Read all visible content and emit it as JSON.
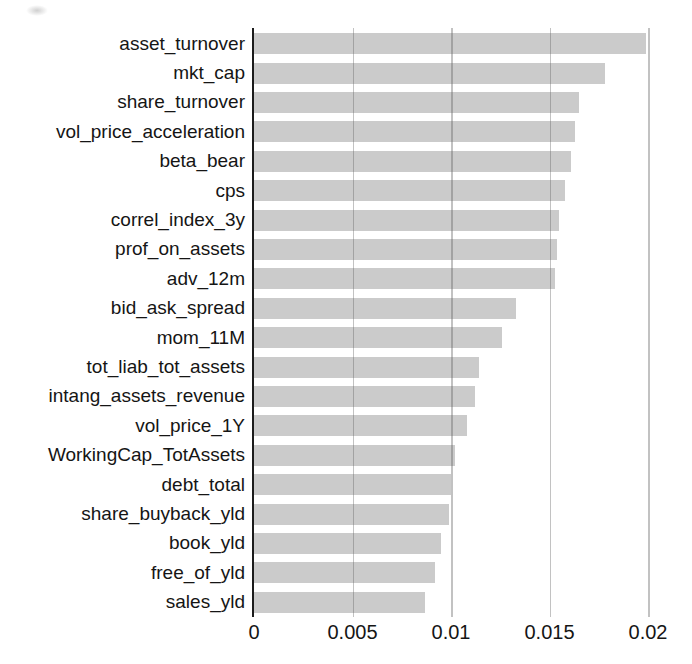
{
  "chart_data": {
    "type": "bar",
    "orientation": "horizontal",
    "title": "",
    "xlabel": "",
    "ylabel": "",
    "categories": [
      "asset_turnover",
      "mkt_cap",
      "share_turnover",
      "vol_price_acceleration",
      "beta_bear",
      "cps",
      "correl_index_3y",
      "prof_on_assets",
      "adv_12m",
      "bid_ask_spread",
      "mom_11M",
      "tot_liab_tot_assets",
      "intang_assets_revenue",
      "vol_price_1Y",
      "WorkingCap_TotAssets",
      "debt_total",
      "share_buyback_yld",
      "book_yld",
      "free_of_yld",
      "sales_yld"
    ],
    "values": [
      0.0199,
      0.0178,
      0.0165,
      0.0163,
      0.0161,
      0.0158,
      0.0155,
      0.0154,
      0.0153,
      0.0133,
      0.0126,
      0.0114,
      0.0112,
      0.0108,
      0.0102,
      0.01,
      0.0099,
      0.0095,
      0.0092,
      0.0087
    ],
    "xlim": [
      0,
      0.0205
    ],
    "x_ticks": [
      0,
      0.005,
      0.01,
      0.015,
      0.02
    ],
    "x_tick_labels": [
      "0",
      "0.005",
      "0.01",
      "0.015",
      "0.02"
    ],
    "grid": true,
    "legend_position": "none",
    "bar_color": "#cbcbcb",
    "gridline_color": "rgba(95,95,95,0.38)",
    "axis_color": "#1c1c1c",
    "text_color": "#151515"
  }
}
